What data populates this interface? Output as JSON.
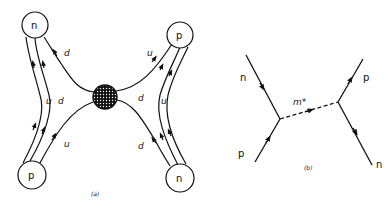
{
  "diagram_a": {
    "caption": "(a)",
    "nucleons": {
      "top_left": "n",
      "bottom_left": "p",
      "top_right": "p",
      "bottom_right": "n"
    },
    "quark_labels": {
      "left_upper_d": "d",
      "left_mid_u": "u",
      "left_mid_d": "d",
      "left_lower_u": "u",
      "right_upper_u": "u",
      "right_mid_d": "d",
      "right_mid_u": "u",
      "right_lower_d": "d"
    },
    "blob": "exchange-blob"
  },
  "diagram_b": {
    "caption": "(b)",
    "labels": {
      "incoming_p": "p",
      "outgoing_n_left": "n",
      "exchange": "m*",
      "outgoing_p_right": "p",
      "outgoing_n_right": "n"
    }
  },
  "colors": {
    "ink": "#111111",
    "background": "#ffffff"
  }
}
